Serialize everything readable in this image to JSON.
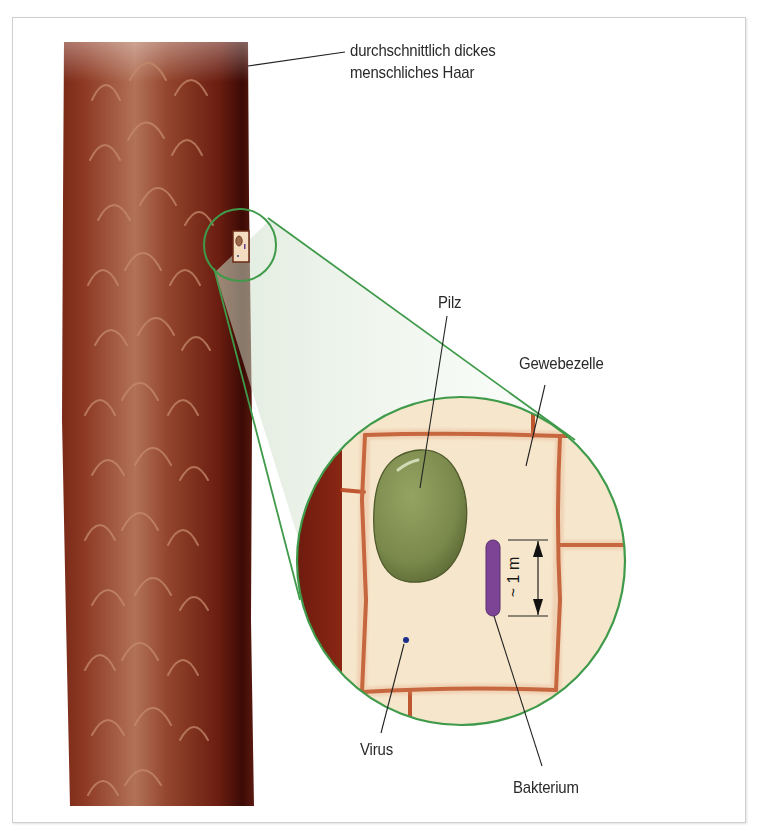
{
  "figure": {
    "labels": {
      "hair": [
        "durchschnittlich dickes",
        "menschliches Haar"
      ],
      "fungus": "Pilz",
      "tissue_cell": "Gewebezelle",
      "bacterium": "Bakterium",
      "virus": "Virus",
      "scale": "~ 1 m"
    },
    "colors": {
      "hair_dark": "#4a0f08",
      "hair_mid": "#8a3a22",
      "hair_light": "#b8765a",
      "zoom_outline": "#3f9a4a",
      "cell_fill": "#f6e6cc",
      "cell_wall": "#b8461e",
      "fungus": "#7d8c4e",
      "bacterium": "#7d4496",
      "virus": "#1b2f8a",
      "leader_line": "#222222"
    }
  }
}
